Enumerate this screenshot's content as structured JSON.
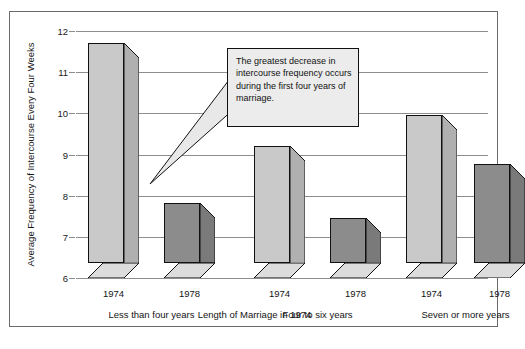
{
  "page": {
    "top_fragment": "",
    "background": "#ffffff"
  },
  "callout": {
    "name": "annotation-callout",
    "text": "The greatest decrease in intercourse frequency occurs during the first four years of marriage.",
    "fill": "#ececec",
    "border": "#111111"
  },
  "axes": {
    "y_title": "Average Frequency of Intercourse Every Four Weeks",
    "x_title": "Length of Marriage in 1974",
    "y_ticks": [
      "12",
      "11",
      "10",
      "9",
      "8",
      "7",
      "6"
    ]
  },
  "chart_data": {
    "type": "bar",
    "title": "",
    "subtitle": "",
    "xlabel": "Length of Marriage in 1974",
    "ylabel": "Average Frequency of Intercourse Every Four Weeks",
    "ylim": [
      6,
      12
    ],
    "yticks": [
      6,
      7,
      8,
      9,
      10,
      11,
      12
    ],
    "grid": true,
    "legend": false,
    "legend_position": "none",
    "categories": [
      "Less than four years",
      "Four to six years",
      "Seven or more years"
    ],
    "series": [
      {
        "name": "1974",
        "color": "#c3c3c3",
        "values": [
          11.35,
          8.85,
          9.6
        ]
      },
      {
        "name": "1978",
        "color": "#8a8a8a",
        "values": [
          7.45,
          7.1,
          8.4
        ]
      }
    ],
    "bars": [
      {
        "group": "Less than four years",
        "year": "1974",
        "value": 11.35,
        "series": "1974"
      },
      {
        "group": "Less than four years",
        "year": "1978",
        "value": 7.45,
        "series": "1978"
      },
      {
        "group": "Four to six years",
        "year": "1974",
        "value": 8.85,
        "series": "1974"
      },
      {
        "group": "Four to six years",
        "year": "1978",
        "value": 7.1,
        "series": "1978"
      },
      {
        "group": "Seven or more years",
        "year": "1974",
        "value": 9.6,
        "series": "1974"
      },
      {
        "group": "Seven or more years",
        "year": "1978",
        "value": 8.4,
        "series": "1978"
      }
    ],
    "annotations": [
      {
        "text": "The greatest decrease in intercourse frequency occurs during the first four years of marriage.",
        "points_to": "Less than four years"
      }
    ]
  },
  "colors": {
    "bar_1974_front": "#c9c9c9",
    "bar_1974_side": "#b0b0b0",
    "bar_1978_front": "#8c8c8c",
    "bar_1978_side": "#7a7a7a",
    "bar_base": "#dcdcdc",
    "gridline": "#8d8d8d",
    "frame": "#6a6a6a",
    "text": "#141414"
  }
}
